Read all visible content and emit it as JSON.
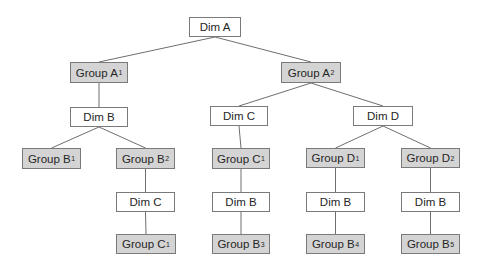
{
  "diagram": {
    "type": "tree",
    "colors": {
      "dim_fill": "#ffffff",
      "group_fill": "#d4d4d4",
      "border": "#7a7a7a",
      "edge": "#6e6e6e",
      "text": "#262626"
    },
    "nodes": [
      {
        "id": "dimA",
        "kind": "dim",
        "label": "Dim A",
        "sub": "",
        "x": 189,
        "y": 17,
        "w": 52,
        "h": 20
      },
      {
        "id": "groupA1",
        "kind": "group",
        "label": "Group A",
        "sub": "1",
        "x": 70,
        "y": 62,
        "w": 58,
        "h": 21
      },
      {
        "id": "groupA2",
        "kind": "group",
        "label": "Group A",
        "sub": "2",
        "x": 281,
        "y": 62,
        "w": 60,
        "h": 21
      },
      {
        "id": "dimB_1",
        "kind": "dim",
        "label": "Dim B",
        "sub": "",
        "x": 70,
        "y": 107,
        "w": 58,
        "h": 20
      },
      {
        "id": "dimC_1",
        "kind": "dim",
        "label": "Dim C",
        "sub": "",
        "x": 210,
        "y": 106,
        "w": 58,
        "h": 20
      },
      {
        "id": "dimD",
        "kind": "dim",
        "label": "Dim D",
        "sub": "",
        "x": 353,
        "y": 106,
        "w": 60,
        "h": 20
      },
      {
        "id": "groupB1",
        "kind": "group",
        "label": "Group B",
        "sub": "1",
        "x": 22,
        "y": 148,
        "w": 59,
        "h": 21
      },
      {
        "id": "groupB2",
        "kind": "group",
        "label": "Group B",
        "sub": "2",
        "x": 116,
        "y": 148,
        "w": 59,
        "h": 21
      },
      {
        "id": "groupC1_a",
        "kind": "group",
        "label": "Group C",
        "sub": "1",
        "x": 212,
        "y": 148,
        "w": 58,
        "h": 21
      },
      {
        "id": "groupD1",
        "kind": "group",
        "label": "Group D",
        "sub": "1",
        "x": 306,
        "y": 148,
        "w": 59,
        "h": 20
      },
      {
        "id": "groupD2",
        "kind": "group",
        "label": "Group D",
        "sub": "2",
        "x": 401,
        "y": 148,
        "w": 59,
        "h": 20
      },
      {
        "id": "dimC_2",
        "kind": "dim",
        "label": "Dim C",
        "sub": "",
        "x": 116,
        "y": 192,
        "w": 59,
        "h": 20
      },
      {
        "id": "dimB_2",
        "kind": "dim",
        "label": "Dim B",
        "sub": "",
        "x": 212,
        "y": 192,
        "w": 58,
        "h": 20
      },
      {
        "id": "dimB_3",
        "kind": "dim",
        "label": "Dim B",
        "sub": "",
        "x": 306,
        "y": 192,
        "w": 59,
        "h": 20
      },
      {
        "id": "dimB_4",
        "kind": "dim",
        "label": "Dim B",
        "sub": "",
        "x": 401,
        "y": 192,
        "w": 59,
        "h": 20
      },
      {
        "id": "groupC1_b",
        "kind": "group",
        "label": "Group C",
        "sub": "1",
        "x": 116,
        "y": 234,
        "w": 60,
        "h": 20
      },
      {
        "id": "groupB3",
        "kind": "group",
        "label": "Group B",
        "sub": "3",
        "x": 212,
        "y": 234,
        "w": 58,
        "h": 20
      },
      {
        "id": "groupB4",
        "kind": "group",
        "label": "Group B",
        "sub": "4",
        "x": 306,
        "y": 234,
        "w": 59,
        "h": 20
      },
      {
        "id": "groupB5",
        "kind": "group",
        "label": "Group B",
        "sub": "5",
        "x": 401,
        "y": 234,
        "w": 59,
        "h": 20
      }
    ],
    "edges": [
      [
        "dimA",
        "groupA1"
      ],
      [
        "dimA",
        "groupA2"
      ],
      [
        "groupA1",
        "dimB_1"
      ],
      [
        "groupA2",
        "dimC_1"
      ],
      [
        "groupA2",
        "dimD"
      ],
      [
        "dimB_1",
        "groupB1"
      ],
      [
        "dimB_1",
        "groupB2"
      ],
      [
        "dimC_1",
        "groupC1_a"
      ],
      [
        "dimD",
        "groupD1"
      ],
      [
        "dimD",
        "groupD2"
      ],
      [
        "groupB2",
        "dimC_2"
      ],
      [
        "groupC1_a",
        "dimB_2"
      ],
      [
        "groupD1",
        "dimB_3"
      ],
      [
        "groupD2",
        "dimB_4"
      ],
      [
        "dimC_2",
        "groupC1_b"
      ],
      [
        "dimB_2",
        "groupB3"
      ],
      [
        "dimB_3",
        "groupB4"
      ],
      [
        "dimB_4",
        "groupB5"
      ]
    ]
  }
}
